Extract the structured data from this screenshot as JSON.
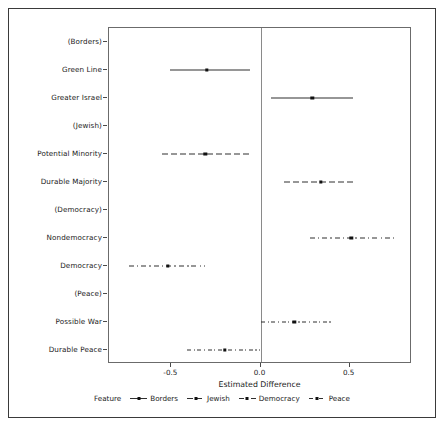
{
  "figure": {
    "caption_faint": ""
  },
  "axes": {
    "x_title": "Estimated Difference",
    "x_ticks": [
      {
        "value": -0.5,
        "label": "-0.5"
      },
      {
        "value": 0.0,
        "label": "0.0"
      },
      {
        "value": 0.5,
        "label": "0.5"
      }
    ],
    "x_min": -0.85,
    "x_max": 0.85,
    "zero_reference": 0.0
  },
  "legend": {
    "title": "Feature",
    "items": [
      {
        "label": "Borders",
        "style": "solid"
      },
      {
        "label": "Jewish",
        "style": "longdash"
      },
      {
        "label": "Democracy",
        "style": "dashdot"
      },
      {
        "label": "Peace",
        "style": "dashdot2"
      }
    ]
  },
  "colors": {
    "line": "#2f2f2f",
    "point": "#111111",
    "panel_border": "#6b6b6b",
    "frame": "#3a3a3a",
    "zero_line": "#8a8a8a"
  },
  "chart_data": {
    "type": "scatter",
    "subtype": "coefficient-plot-with-error-bars",
    "title": "",
    "xlabel": "Estimated Difference",
    "ylabel": "",
    "xlim": [
      -0.85,
      0.85
    ],
    "grid": false,
    "legend_position": "bottom",
    "legend_title": "Feature",
    "reference_line_x": 0.0,
    "categories": [
      "(Borders)",
      "Green Line",
      "Greater Israel",
      "(Jewish)",
      "Potential Minority",
      "Durable Majority",
      "(Democracy)",
      "Nondemocracy",
      "Democracy",
      "(Peace)",
      "Possible War",
      "Durable Peace"
    ],
    "points": [
      {
        "label": "(Borders)",
        "feature": "Borders",
        "style": "solid",
        "estimate": null,
        "low": null,
        "high": null,
        "reference": true
      },
      {
        "label": "Green Line",
        "feature": "Borders",
        "style": "solid",
        "estimate": -0.3,
        "low": -0.51,
        "high": -0.06,
        "reference": false
      },
      {
        "label": "Greater Israel",
        "feature": "Borders",
        "style": "solid",
        "estimate": 0.29,
        "low": 0.06,
        "high": 0.52,
        "reference": false
      },
      {
        "label": "(Jewish)",
        "feature": "Jewish",
        "style": "longdash",
        "estimate": null,
        "low": null,
        "high": null,
        "reference": true
      },
      {
        "label": "Potential Minority",
        "feature": "Jewish",
        "style": "longdash",
        "estimate": -0.31,
        "low": -0.55,
        "high": -0.05,
        "reference": false
      },
      {
        "label": "Durable Majority",
        "feature": "Jewish",
        "style": "longdash",
        "estimate": 0.34,
        "low": 0.13,
        "high": 0.53,
        "reference": false
      },
      {
        "label": "(Democracy)",
        "feature": "Democracy",
        "style": "dashdot",
        "estimate": null,
        "low": null,
        "high": null,
        "reference": true
      },
      {
        "label": "Nondemocracy",
        "feature": "Democracy",
        "style": "dashdot",
        "estimate": 0.51,
        "low": 0.28,
        "high": 0.75,
        "reference": false
      },
      {
        "label": "Democracy",
        "feature": "Democracy",
        "style": "dashdot",
        "estimate": -0.52,
        "low": -0.74,
        "high": -0.31,
        "reference": false
      },
      {
        "label": "(Peace)",
        "feature": "Peace",
        "style": "dashdot2",
        "estimate": null,
        "low": null,
        "high": null,
        "reference": true
      },
      {
        "label": "Possible War",
        "feature": "Peace",
        "style": "dashdot2",
        "estimate": 0.19,
        "low": 0.0,
        "high": 0.4,
        "reference": false
      },
      {
        "label": "Durable Peace",
        "feature": "Peace",
        "style": "dashdot2",
        "estimate": -0.2,
        "low": -0.41,
        "high": 0.0,
        "reference": false
      }
    ]
  }
}
